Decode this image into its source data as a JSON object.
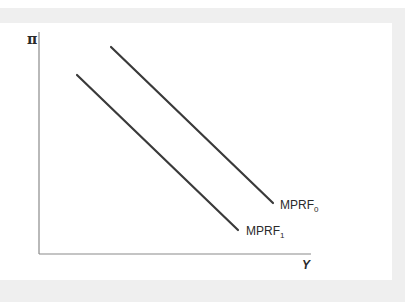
{
  "diagram": {
    "type": "economics-curve-shift",
    "axes": {
      "y_label": "π",
      "x_label": "Y"
    },
    "curves": [
      {
        "id": "MPRF0",
        "name": "MPRF",
        "subscript": "0",
        "x1": 111,
        "y1": 47,
        "x2": 273,
        "y2": 203
      },
      {
        "id": "MPRF1",
        "name": "MPRF",
        "subscript": "1",
        "x1": 77,
        "y1": 75,
        "x2": 238,
        "y2": 230
      }
    ],
    "colors": {
      "line": "#3a3a3a",
      "axis": "#8a8a8a",
      "frame": "#efefef"
    }
  }
}
